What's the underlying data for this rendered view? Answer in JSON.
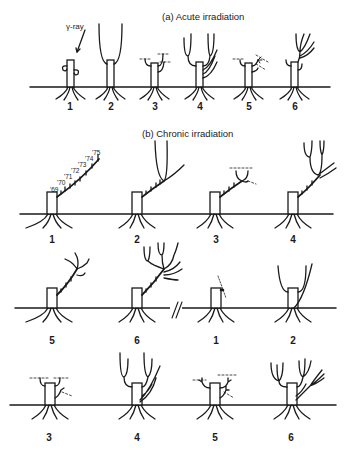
{
  "figure": {
    "panel_a": {
      "title": "(a)  Acute irradiation",
      "annotation": "γ-ray",
      "stage_labels": [
        "1",
        "2",
        "3",
        "4",
        "5",
        "6"
      ]
    },
    "panel_b": {
      "title": "(b)  Chronic irradiation",
      "year_labels": [
        "'69",
        "'70",
        "'71",
        "'72",
        "'73",
        "'74",
        "'75"
      ],
      "row1_labels": [
        "1",
        "2",
        "3",
        "4"
      ],
      "row2_labels": [
        "5",
        "6",
        "1",
        "2"
      ],
      "row3_labels": [
        "3",
        "4",
        "5",
        "6"
      ],
      "break_mark": "//"
    },
    "caption_cutoff": "…"
  }
}
